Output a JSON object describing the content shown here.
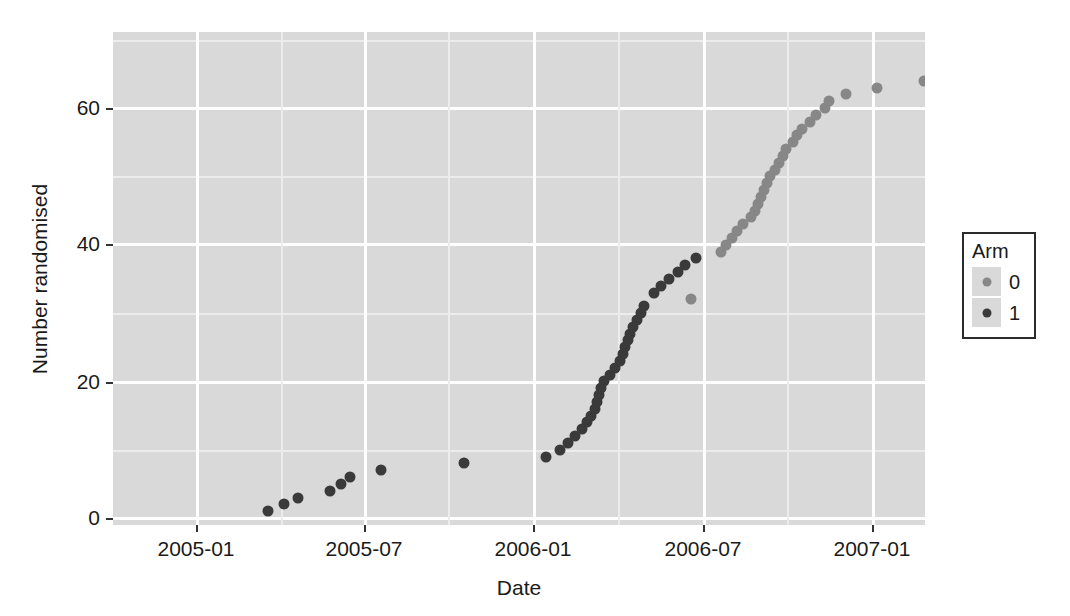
{
  "chart_data": {
    "type": "scatter",
    "title": "",
    "xlabel": "Date",
    "ylabel": "Number randomised",
    "xtick_labels": [
      "2005-01",
      "2005-07",
      "2006-01",
      "2006-07",
      "2007-01"
    ],
    "xtick_values": [
      "2005-01-01",
      "2005-07-01",
      "2006-01-01",
      "2006-07-01",
      "2007-01-01"
    ],
    "ytick_labels": [
      "0",
      "20",
      "40",
      "60"
    ],
    "ytick_values": [
      0,
      20,
      40,
      60
    ],
    "ylim": [
      -2.5,
      69.5
    ],
    "xlim": [
      "2004-09-20",
      "2007-03-20"
    ],
    "grid": "major and minor white gridlines on grey panel",
    "legend": {
      "title": "Arm",
      "position": "right",
      "entries": [
        {
          "label": "0",
          "color": "#878787"
        },
        {
          "label": "1",
          "color": "#3a3a3a"
        }
      ]
    },
    "colors": {
      "panel_background": "#d9d9d9",
      "major_gridline": "#ffffff",
      "minor_gridline": "#ececec",
      "figure_background": "#ffffff",
      "arm0": "#878787",
      "arm1": "#3a3a3a",
      "axis_text": "#1a1a1a"
    },
    "series": [
      {
        "name": "0",
        "color": "#878787",
        "points": [
          {
            "x": 577.5,
            "y": 32
          },
          {
            "x": 608.0,
            "y": 39
          },
          {
            "x": 613.0,
            "y": 40
          },
          {
            "x": 618.5,
            "y": 41
          },
          {
            "x": 623.5,
            "y": 42
          },
          {
            "x": 630.0,
            "y": 43
          },
          {
            "x": 638.0,
            "y": 44
          },
          {
            "x": 641.5,
            "y": 45
          },
          {
            "x": 645.0,
            "y": 46
          },
          {
            "x": 648.0,
            "y": 47
          },
          {
            "x": 651.0,
            "y": 48
          },
          {
            "x": 654.0,
            "y": 49
          },
          {
            "x": 656.5,
            "y": 50
          },
          {
            "x": 662.0,
            "y": 51
          },
          {
            "x": 665.5,
            "y": 52
          },
          {
            "x": 669.5,
            "y": 53
          },
          {
            "x": 673.0,
            "y": 54
          },
          {
            "x": 679.5,
            "y": 55
          },
          {
            "x": 683.5,
            "y": 56
          },
          {
            "x": 689.0,
            "y": 57
          },
          {
            "x": 697.0,
            "y": 58
          },
          {
            "x": 702.5,
            "y": 59
          },
          {
            "x": 712.0,
            "y": 60
          },
          {
            "x": 716.0,
            "y": 61
          },
          {
            "x": 733.0,
            "y": 62
          },
          {
            "x": 764.0,
            "y": 63
          },
          {
            "x": 811.0,
            "y": 64
          },
          {
            "x": 880.0,
            "y": 66
          }
        ]
      },
      {
        "name": "1",
        "color": "#3a3a3a",
        "points": [
          {
            "x": 155.0,
            "y": 1
          },
          {
            "x": 171.0,
            "y": 2
          },
          {
            "x": 185.0,
            "y": 3
          },
          {
            "x": 217.0,
            "y": 4
          },
          {
            "x": 228.0,
            "y": 5
          },
          {
            "x": 237.0,
            "y": 6
          },
          {
            "x": 268.0,
            "y": 7
          },
          {
            "x": 351.0,
            "y": 8
          },
          {
            "x": 433.0,
            "y": 9
          },
          {
            "x": 447.0,
            "y": 10
          },
          {
            "x": 455.0,
            "y": 11
          },
          {
            "x": 462.0,
            "y": 12
          },
          {
            "x": 469.0,
            "y": 13
          },
          {
            "x": 474.0,
            "y": 14
          },
          {
            "x": 478.0,
            "y": 15
          },
          {
            "x": 481.5,
            "y": 16
          },
          {
            "x": 483.5,
            "y": 17
          },
          {
            "x": 486.0,
            "y": 18
          },
          {
            "x": 488.0,
            "y": 19
          },
          {
            "x": 490.5,
            "y": 20
          },
          {
            "x": 497.0,
            "y": 21
          },
          {
            "x": 502.0,
            "y": 22
          },
          {
            "x": 507.0,
            "y": 23
          },
          {
            "x": 509.5,
            "y": 24
          },
          {
            "x": 511.5,
            "y": 25
          },
          {
            "x": 514.5,
            "y": 26
          },
          {
            "x": 517.0,
            "y": 27
          },
          {
            "x": 520.0,
            "y": 28
          },
          {
            "x": 524.0,
            "y": 29
          },
          {
            "x": 527.5,
            "y": 30
          },
          {
            "x": 531.0,
            "y": 31
          },
          {
            "x": 541.0,
            "y": 33
          },
          {
            "x": 547.5,
            "y": 34
          },
          {
            "x": 556.0,
            "y": 35
          },
          {
            "x": 565.0,
            "y": 36
          },
          {
            "x": 572.0,
            "y": 37
          },
          {
            "x": 583.0,
            "y": 38
          },
          {
            "x": 902.0,
            "y": 67
          }
        ]
      }
    ]
  },
  "axes": {
    "panel": {
      "left": 113,
      "top": 32,
      "width": 812,
      "height": 493
    },
    "y_major_px": [
      108,
      244,
      382,
      518
    ],
    "y_minor_px": [
      176,
      313,
      450,
      55
    ],
    "x_major_px": [
      196,
      364,
      533,
      703,
      872
    ],
    "x_minor_px": [
      281,
      448,
      618,
      787
    ]
  }
}
